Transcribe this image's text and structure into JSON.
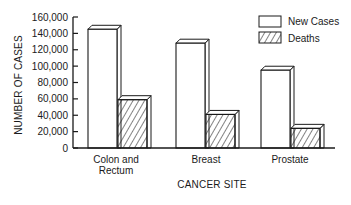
{
  "chart_data": {
    "type": "bar",
    "style": "3d-grouped",
    "title": "",
    "xlabel": "CANCER SITE",
    "ylabel": "NUMBER OF CASES",
    "ylim": [
      0,
      160000
    ],
    "yticks": [
      0,
      20000,
      40000,
      60000,
      80000,
      100000,
      120000,
      140000,
      160000
    ],
    "ytick_labels": [
      "0",
      "20,000",
      "40,000",
      "60,000",
      "80,000",
      "100,000",
      "120,000",
      "140,000",
      "160,000"
    ],
    "categories": [
      "Colon and Rectum",
      "Breast",
      "Prostate"
    ],
    "category_lines": [
      [
        "Colon and",
        "Rectum"
      ],
      [
        "Breast"
      ],
      [
        "Prostate"
      ]
    ],
    "series": [
      {
        "name": "New Cases",
        "pattern": "none",
        "values": [
          145000,
          128000,
          95000
        ]
      },
      {
        "name": "Deaths",
        "pattern": "diagonal-hatch",
        "values": [
          59000,
          41000,
          24000
        ]
      }
    ],
    "grid": false,
    "legend_position": "upper-right"
  },
  "legend": {
    "items": [
      {
        "label": "New Cases",
        "pattern": "none"
      },
      {
        "label": "Deaths",
        "pattern": "diagonal-hatch"
      }
    ]
  },
  "colors": {
    "ink": "#1a1a1a",
    "fill": "#ffffff"
  }
}
